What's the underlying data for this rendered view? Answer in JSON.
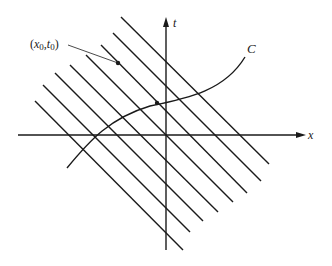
{
  "diagram": {
    "axes": {
      "x_label": "x",
      "t_label": "t",
      "origin": [
        166,
        135
      ]
    },
    "curve_label": "C",
    "point_label_x": "x",
    "point_label_x_sub": "0",
    "point_label_sep": ",",
    "point_label_t": "t",
    "point_label_t_sub": "0",
    "point_label_open": "(",
    "point_label_close": ")",
    "characteristic_lines": [
      {
        "x1": 121,
        "y1": 17,
        "x2": 269,
        "y2": 164
      },
      {
        "x1": 113,
        "y1": 33,
        "x2": 261,
        "y2": 181
      },
      {
        "x1": 101,
        "y1": 45,
        "x2": 247,
        "y2": 193
      },
      {
        "x1": 86,
        "y1": 55,
        "x2": 233,
        "y2": 202
      },
      {
        "x1": 70,
        "y1": 65,
        "x2": 218,
        "y2": 212
      },
      {
        "x1": 55,
        "y1": 73,
        "x2": 203,
        "y2": 221
      },
      {
        "x1": 43,
        "y1": 85,
        "x2": 190,
        "y2": 232
      },
      {
        "x1": 35,
        "y1": 101,
        "x2": 183,
        "y2": 250
      }
    ],
    "point": {
      "x": 118,
      "y": 63
    },
    "curve_point": {
      "x": 157,
      "y": 103
    },
    "colors": {
      "ink": "#1a1a1a",
      "background": "#ffffff"
    }
  }
}
